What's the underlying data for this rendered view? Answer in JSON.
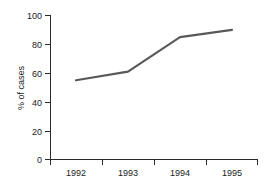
{
  "chart_data": {
    "type": "line",
    "title": "",
    "subtitle": "",
    "xlabel": "",
    "ylabel": "% of cases",
    "categories": [
      "1992",
      "1993",
      "1994",
      "1995"
    ],
    "x": [
      1992,
      1993,
      1994,
      1995
    ],
    "values": [
      55,
      61,
      85,
      90
    ],
    "series": [
      {
        "name": "% of cases",
        "values": [
          55,
          61,
          85,
          90
        ]
      }
    ],
    "ylim": [
      0,
      100
    ],
    "ytick_labels": [
      "0",
      "20",
      "40",
      "60",
      "80",
      "100"
    ],
    "ytick_values": [
      0,
      20,
      40,
      60,
      80,
      100
    ],
    "xtick_labels": [
      "1992",
      "1993",
      "1994",
      "1995"
    ],
    "grid": false,
    "legend": false,
    "legend_position": "none",
    "annotations": [],
    "line_color": "#595959",
    "axis_color": "#2b2b2b",
    "background_color": "#ffffff"
  },
  "axes": {
    "y_ticks": [
      {
        "label": "100",
        "value": 100
      },
      {
        "label": "80",
        "value": 80
      },
      {
        "label": "60",
        "value": 60
      },
      {
        "label": "40",
        "value": 40
      },
      {
        "label": "20",
        "value": 20
      },
      {
        "label": "0",
        "value": 0
      }
    ],
    "x_ticks": [
      {
        "label": "1992"
      },
      {
        "label": "1993"
      },
      {
        "label": "1994"
      },
      {
        "label": "1995"
      }
    ],
    "y_axis_title": "% of cases"
  }
}
